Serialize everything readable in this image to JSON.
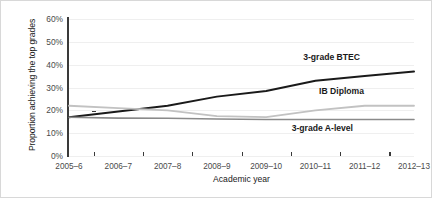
{
  "chart_data": {
    "type": "line",
    "title": "",
    "xlabel": "Academic year",
    "ylabel": "Proportion achieving the top grades",
    "categories": [
      "2005–6",
      "2006–7",
      "2007–8",
      "2008–9",
      "2009–10",
      "2010–11",
      "2011–12",
      "2012–13"
    ],
    "ylim": [
      0,
      60
    ],
    "ytick_labels": [
      "0%",
      "10%",
      "20%",
      "30%",
      "40%",
      "50%",
      "60%"
    ],
    "ytick_values": [
      0,
      10,
      20,
      30,
      40,
      50,
      60
    ],
    "grid": "horizontal",
    "legend_position": "inline-right",
    "series": [
      {
        "name": "3-grade BTEC",
        "color": "#1a1a1a",
        "width": 2.0,
        "values": [
          17,
          19.5,
          22,
          26,
          28.5,
          33,
          35,
          37
        ]
      },
      {
        "name": "IB Diploma",
        "color": "#c2c2c2",
        "width": 1.8,
        "values": [
          22,
          21,
          20,
          17.5,
          17,
          20,
          22,
          22
        ]
      },
      {
        "name": "3-grade A-level",
        "color": "#8a8a8a",
        "width": 1.6,
        "values": [
          17,
          16.6,
          16.5,
          16.2,
          16,
          16,
          16,
          16
        ]
      }
    ],
    "annotations": [
      {
        "text": "3-grade BTEC",
        "x_px": 359,
        "y_px": 56
      },
      {
        "text": "IB Diploma",
        "x_px": 363,
        "y_px": 90
      },
      {
        "text": "3-grade A-level",
        "x_px": 352,
        "y_px": 127
      }
    ]
  }
}
